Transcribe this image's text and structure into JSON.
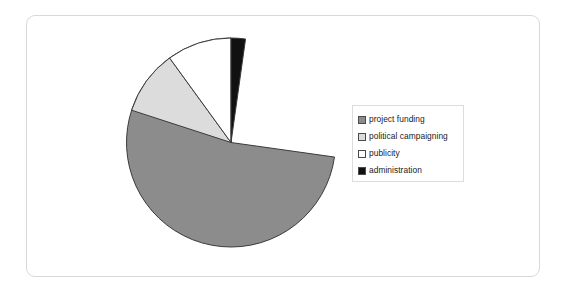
{
  "chart_data": {
    "type": "pie",
    "title": "",
    "subtitle": "",
    "xlabel": "",
    "ylabel": "",
    "legend_position": "right",
    "grid": false,
    "start_angle_deg": 90,
    "direction": "counterclockwise",
    "categories": [
      "project funding",
      "political campaigning",
      "publicity",
      "administration"
    ],
    "values": [
      78.0,
      10.0,
      9.7,
      2.3
    ],
    "units": "percent",
    "slices": [
      {
        "label": "project funding",
        "value": 78.0,
        "color": "#8c8c8c",
        "start_deg": 90.0,
        "end_deg": 352.0
      },
      {
        "label": "political campaigning",
        "value": 10.0,
        "color": "#dcdcdc",
        "start_deg": 126.0,
        "end_deg": 162.0
      },
      {
        "label": "publicity",
        "value": 9.7,
        "color": "#ffffff",
        "start_deg": 90.0,
        "end_deg": 126.0
      },
      {
        "label": "administration",
        "value": 2.3,
        "color": "#111111",
        "start_deg": 82.0,
        "end_deg": 90.0
      }
    ]
  },
  "colors": {
    "project_funding": "#8c8c8c",
    "political_campaigning": "#dcdcdc",
    "publicity": "#ffffff",
    "administration": "#111111",
    "slice_outline": "#3a3a3a",
    "frame_border": "#d8d8d8",
    "legend_border": "#dcdcdc",
    "background": "#ffffff",
    "text": "#1a1a1a"
  },
  "legend": {
    "items": [
      {
        "label": "project funding",
        "swatch_color": "#8c8c8c"
      },
      {
        "label": "political campaigning",
        "swatch_color": "#dcdcdc"
      },
      {
        "label": "publicity",
        "swatch_color": "#ffffff"
      },
      {
        "label": "administration",
        "swatch_color": "#111111"
      }
    ]
  },
  "geometry": {
    "center_x": 231,
    "center_y": 142.5,
    "radius": 104.5
  }
}
